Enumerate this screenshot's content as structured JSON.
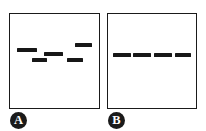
{
  "figure": {
    "background_color": "#ffffff",
    "ink_color": "#1a1a1a",
    "band_color": "#171717",
    "panels": [
      {
        "id": "A",
        "label": "A",
        "label_shape": "filled-circle",
        "label_text_color": "#ffffff",
        "description": "Five bands at five different vertical migration levels (staggered / scattered pattern)",
        "band_count": 5,
        "bands": [
          {
            "name": "band-a-1",
            "lane": 1,
            "left_pct": 7.7,
            "top_pct": 36.5,
            "width_pct": 23.1,
            "height_pct": 3.6,
            "level": "middle-upper"
          },
          {
            "name": "band-a-2",
            "lane": 2,
            "left_pct": 24.2,
            "top_pct": 47.0,
            "width_pct": 17.6,
            "height_pct": 3.6,
            "level": "lower"
          },
          {
            "name": "band-a-3",
            "lane": 3,
            "left_pct": 38.5,
            "top_pct": 40.6,
            "width_pct": 20.9,
            "height_pct": 3.6,
            "level": "middle"
          },
          {
            "name": "band-a-4",
            "lane": 4,
            "left_pct": 63.7,
            "top_pct": 47.0,
            "width_pct": 18.7,
            "height_pct": 3.6,
            "level": "lower"
          },
          {
            "name": "band-a-5",
            "lane": 5,
            "left_pct": 72.5,
            "top_pct": 31.3,
            "width_pct": 19.8,
            "height_pct": 3.6,
            "level": "upper"
          }
        ]
      },
      {
        "id": "B",
        "label": "B",
        "label_shape": "filled-circle",
        "label_text_color": "#ffffff",
        "description": "Four bands all aligned at the same vertical migration level (uniform pattern)",
        "band_count": 4,
        "bands": [
          {
            "name": "band-b-1",
            "lane": 1,
            "left_pct": 5.6,
            "top_pct": 41.7,
            "width_pct": 20.0,
            "height_pct": 3.6,
            "level": "middle"
          },
          {
            "name": "band-b-2",
            "lane": 2,
            "left_pct": 28.9,
            "top_pct": 41.7,
            "width_pct": 20.0,
            "height_pct": 3.6,
            "level": "middle"
          },
          {
            "name": "band-b-3",
            "lane": 3,
            "left_pct": 52.2,
            "top_pct": 41.7,
            "width_pct": 20.0,
            "height_pct": 3.6,
            "level": "middle"
          },
          {
            "name": "band-b-4",
            "lane": 4,
            "left_pct": 75.6,
            "top_pct": 41.7,
            "width_pct": 18.9,
            "height_pct": 3.6,
            "level": "middle"
          }
        ]
      }
    ]
  }
}
